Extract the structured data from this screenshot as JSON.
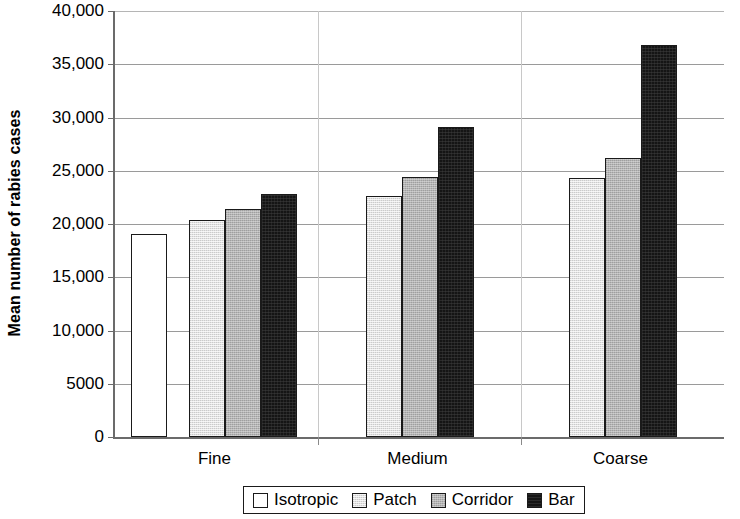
{
  "chart_data": {
    "type": "bar",
    "title": "",
    "xlabel": "",
    "ylabel": "Mean number of rabies cases",
    "ylim": [
      0,
      40000
    ],
    "ytick_labels": [
      "40,000",
      "35,000",
      "30,000",
      "25,000",
      "20,000",
      "15,000",
      "10,000",
      "5000",
      "0"
    ],
    "ytick_values": [
      40000,
      35000,
      30000,
      25000,
      20000,
      15000,
      10000,
      5000,
      0
    ],
    "categories": [
      "Fine",
      "Medium",
      "Coarse"
    ],
    "grid": "horizontal",
    "legend_position": "bottom-center",
    "series": [
      {
        "name": "Isotropic",
        "color": "#ffffff",
        "values": [
          19100,
          null,
          null
        ]
      },
      {
        "name": "Patch",
        "color": "#e2e2e2",
        "values": [
          20400,
          22600,
          24300
        ]
      },
      {
        "name": "Corridor",
        "color": "#b4b4b4",
        "values": [
          21400,
          24450,
          26200
        ]
      },
      {
        "name": "Bar",
        "color": "#151515",
        "values": [
          22800,
          29100,
          36800
        ]
      }
    ]
  },
  "axis": {
    "y_title": "Mean number of rabies cases"
  },
  "legend": {
    "items": [
      {
        "label": "Isotropic",
        "swatch": "isotropic"
      },
      {
        "label": "Patch",
        "swatch": "patch"
      },
      {
        "label": "Corridor",
        "swatch": "corridor"
      },
      {
        "label": "Bar",
        "swatch": "barfrag"
      }
    ]
  }
}
